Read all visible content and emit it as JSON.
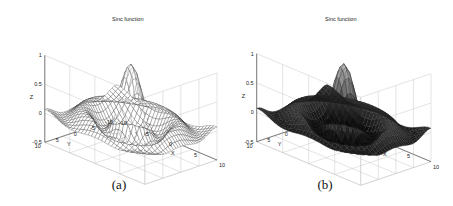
{
  "chart_data": [
    {
      "type": "surface",
      "panel": "a",
      "style": "mesh (white faces, dark edges)",
      "title": "Sinc function",
      "xlabel": "X",
      "ylabel": "Y",
      "zlabel": "Z",
      "xlim": [
        -10,
        10
      ],
      "ylim": [
        -10,
        10
      ],
      "zlim": [
        -0.5,
        1
      ],
      "xticks": [
        "-10",
        "-5",
        "0",
        "5",
        "10"
      ],
      "yticks": [
        "-10",
        "-5",
        "0",
        "5",
        "10"
      ],
      "zticks": [
        "-0.5",
        "0",
        "0.5",
        "1"
      ],
      "function": "z = sin(r)/r, r = sqrt(x^2 + y^2)",
      "peak": {
        "x": 0,
        "y": 0,
        "z": 1
      },
      "caption": "(a)"
    },
    {
      "type": "surface",
      "panel": "b",
      "style": "shaded (dark faces)",
      "title": "Sinc function",
      "xlabel": "X",
      "ylabel": "Y",
      "zlabel": "Z",
      "xlim": [
        -10,
        10
      ],
      "ylim": [
        -10,
        10
      ],
      "zlim": [
        -0.5,
        1
      ],
      "xticks": [
        "-10",
        "-5",
        "0",
        "5",
        "10"
      ],
      "yticks": [
        "-10",
        "-5",
        "0",
        "5",
        "10"
      ],
      "zticks": [
        "-0.5",
        "0",
        "0.5",
        "1"
      ],
      "function": "z = sin(r)/r, r = sqrt(x^2 + y^2)",
      "peak": {
        "x": 0,
        "y": 0,
        "z": 1
      },
      "caption": "(b)"
    }
  ],
  "panels": [
    {
      "title": "Sinc function",
      "caption": "(a)",
      "xlabel": "X",
      "ylabel": "Y",
      "zlabel": "Z",
      "xticks": [
        "-10",
        "-5",
        "0",
        "5",
        "10"
      ],
      "yticks": [
        "10",
        "5",
        "0",
        "-5",
        "-10"
      ],
      "zticks": [
        "1",
        "0.5",
        "0",
        "-0.5"
      ]
    },
    {
      "title": "Sinc function",
      "caption": "(b)",
      "xlabel": "X",
      "ylabel": "Y",
      "zlabel": "Z",
      "xticks": [
        "-10",
        "-5",
        "0",
        "5",
        "10"
      ],
      "yticks": [
        "10",
        "5",
        "0",
        "-5",
        "-10"
      ],
      "zticks": [
        "1",
        "0.5",
        "0",
        "-0.5"
      ]
    }
  ]
}
